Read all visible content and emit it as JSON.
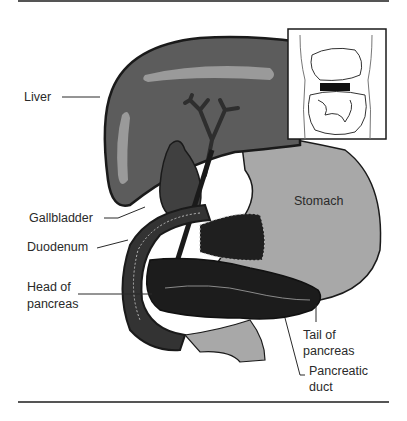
{
  "figure": {
    "type": "anatomical-diagram",
    "labels": {
      "liver": "Liver",
      "gallbladder": "Gallbladder",
      "duodenum": "Duodenum",
      "head_line1": "Head of",
      "head_line2": "pancreas",
      "stomach": "Stomach",
      "tail_line1": "Tail of",
      "tail_line2": "pancreas",
      "duct_line1": "Pancreatic",
      "duct_line2": "duct"
    },
    "inset": {
      "description": "Torso outline showing location of organs, pancreas highlighted in black"
    },
    "colors": {
      "liver": "#5c5c5c",
      "liver_highlight": "#9a9a9a",
      "gallbladder": "#404040",
      "stomach": "#a8a8a8",
      "pancreas": "#1c1c1c",
      "duodenum": "#333333",
      "outline": "#1a1a1a",
      "rule": "#555555"
    }
  }
}
